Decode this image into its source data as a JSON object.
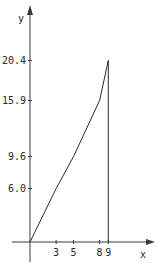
{
  "chart_data": {
    "type": "line",
    "title": "",
    "xlabel": "x",
    "ylabel": "y",
    "x": [
      0,
      3,
      5,
      8,
      9
    ],
    "series": [
      {
        "name": "y",
        "values": [
          0,
          6.0,
          9.6,
          15.9,
          20.4
        ]
      }
    ],
    "x_ticks": [
      3,
      5,
      8,
      9
    ],
    "x_tick_labels": [
      "3",
      "5",
      "8",
      "9"
    ],
    "y_ticks": [
      6.0,
      9.6,
      15.9,
      20.4
    ],
    "y_tick_labels": [
      "6.0",
      "9.6",
      "15.9",
      "20.4"
    ],
    "xlim": [
      0,
      14
    ],
    "ylim": [
      0,
      26
    ],
    "grid": false,
    "legend": "none",
    "annotations": [
      "vertical line from (9, 20.4) down to x-axis"
    ]
  },
  "colors": {
    "line": "#2a2a2a",
    "axis": "#3a3a3a",
    "background": "#ffffff"
  }
}
